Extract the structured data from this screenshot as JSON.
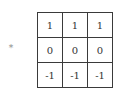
{
  "operator": {
    "symbol": "*"
  },
  "kernel": {
    "rows": [
      [
        "1",
        "1",
        "1"
      ],
      [
        "0",
        "0",
        "0"
      ],
      [
        "-1",
        "-1",
        "-1"
      ]
    ]
  }
}
